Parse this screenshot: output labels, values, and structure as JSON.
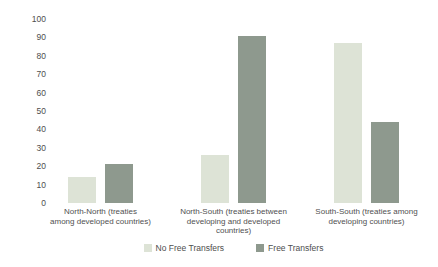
{
  "chart_data": {
    "type": "bar",
    "title": "",
    "xlabel": "",
    "ylabel": "",
    "categories": [
      "North-North (treaties\namong developed countries)",
      "North-South (treaties between\ndeveloping and developed\ncountries)",
      "South-South (treaties among\ndeveloping countries)"
    ],
    "series": [
      {
        "name": "No Free Transfers",
        "color": "#dde3d6",
        "values": [
          14,
          26,
          87
        ]
      },
      {
        "name": "Free Transfers",
        "color": "#8e998e",
        "values": [
          21,
          91,
          44
        ]
      }
    ],
    "ylim": [
      0,
      100
    ],
    "y_ticks": [
      100,
      90,
      80,
      70,
      60,
      50,
      40,
      30,
      20,
      10,
      0
    ],
    "grid": false,
    "legend_position": "bottom"
  }
}
